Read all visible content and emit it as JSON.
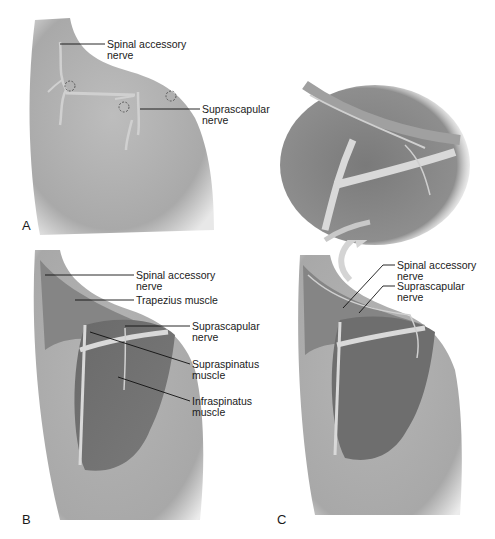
{
  "figure": {
    "panels": [
      {
        "id": "A",
        "panel_label": "A",
        "labels": [
          {
            "line1": "Spinal accessory",
            "line2": "nerve"
          },
          {
            "line1": "Suprascapular",
            "line2": "nerve"
          }
        ]
      },
      {
        "id": "B",
        "panel_label": "B",
        "labels": [
          {
            "line1": "Spinal accessory",
            "line2": "nerve"
          },
          {
            "line1": "Trapezius muscle",
            "line2": ""
          },
          {
            "line1": "Suprascapular",
            "line2": "nerve"
          },
          {
            "line1": "Supraspinatus",
            "line2": "muscle"
          },
          {
            "line1": "Infraspinatus",
            "line2": "muscle"
          }
        ]
      },
      {
        "id": "C",
        "panel_label": "C",
        "labels": [
          {
            "line1": "Spinal accessory",
            "line2": "nerve"
          },
          {
            "line1": "Suprascapular",
            "line2": "nerve"
          }
        ]
      },
      {
        "id": "C-inset",
        "panel_label": "",
        "labels": []
      }
    ],
    "colors": {
      "skin": "#b8b8b8",
      "skin_dark": "#8f8f8f",
      "muscle": "#6e6e6e",
      "nerve": "#d9d9d9",
      "text": "#1a1a1a"
    }
  }
}
